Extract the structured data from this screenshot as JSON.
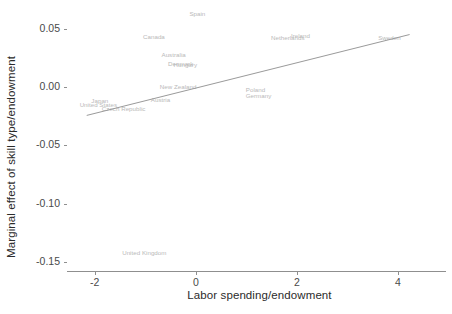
{
  "chart_data": {
    "type": "scatter",
    "title": "",
    "xlabel": "Labor spending/endowment",
    "ylabel": "Marginal effect of skill type/endowment",
    "xlim": [
      -2.55,
      4.95
    ],
    "ylim": [
      -0.158,
      0.068
    ],
    "xticks": [
      "-2",
      "0",
      "2",
      "4"
    ],
    "xtick_values": [
      -2,
      0,
      2,
      4
    ],
    "yticks": [
      "0.05",
      "0.00",
      "-0.05",
      "-0.10",
      "-0.15"
    ],
    "ytick_values": [
      0.05,
      0.0,
      -0.05,
      -0.1,
      -0.15
    ],
    "grid": false,
    "legend": "none",
    "label_color": "#b9b9b9",
    "line_color": "#9a9a9a",
    "axis_color": "#8f8f8f",
    "points": [
      {
        "label": "Spain",
        "x": 0.03,
        "y": 0.0635
      },
      {
        "label": "Canada",
        "x": -0.83,
        "y": 0.0437
      },
      {
        "label": "Ireland",
        "x": 2.07,
        "y": 0.0452
      },
      {
        "label": "Netherlands",
        "x": 1.82,
        "y": 0.0428
      },
      {
        "label": "Sweden",
        "x": 3.83,
        "y": 0.043
      },
      {
        "label": "Australia",
        "x": -0.44,
        "y": 0.0281
      },
      {
        "label": "Denmark",
        "x": -0.3,
        "y": 0.0208
      },
      {
        "label": "Hungary",
        "x": -0.21,
        "y": 0.0198
      },
      {
        "label": "New Zealand",
        "x": -0.35,
        "y": 0.0008
      },
      {
        "label": "Poland",
        "x": 1.18,
        "y": -0.0014
      },
      {
        "label": "Germany",
        "x": 1.24,
        "y": -0.0064
      },
      {
        "label": "Austria",
        "x": -0.7,
        "y": -0.0098
      },
      {
        "label": "Japan",
        "x": -1.9,
        "y": -0.0112
      },
      {
        "label": "United States",
        "x": -1.93,
        "y": -0.0145
      },
      {
        "label": "Czech Republic",
        "x": -1.43,
        "y": -0.0178
      },
      {
        "label": "United Kingdom",
        "x": -1.02,
        "y": -0.1418
      }
    ],
    "fit_line": {
      "x_start": -2.16,
      "y_start": -0.0243,
      "x_end": 4.23,
      "y_end": 0.0452
    }
  }
}
